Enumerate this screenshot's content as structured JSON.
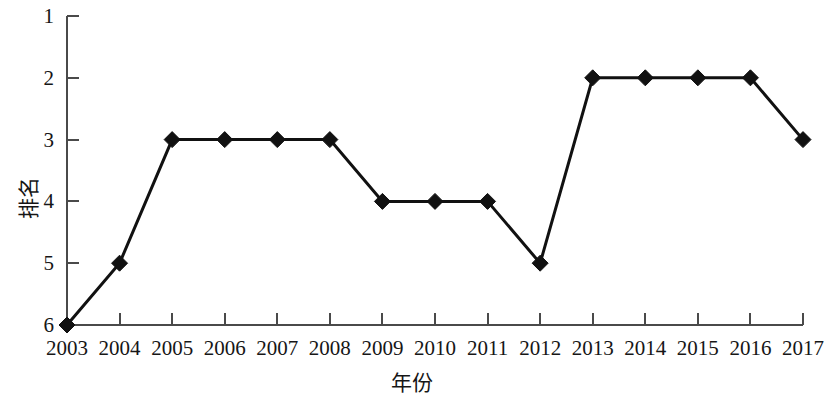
{
  "chart_data": {
    "type": "line",
    "title": "",
    "xlabel": "年份",
    "ylabel": "排名",
    "x": [
      2003,
      2004,
      2005,
      2006,
      2007,
      2008,
      2009,
      2010,
      2011,
      2012,
      2013,
      2014,
      2015,
      2016,
      2017
    ],
    "categories": [
      "2003",
      "2004",
      "2005",
      "2006",
      "2007",
      "2008",
      "2009",
      "2010",
      "2011",
      "2012",
      "2013",
      "2014",
      "2015",
      "2016",
      "2017"
    ],
    "values": [
      6,
      5,
      3,
      3,
      3,
      3,
      4,
      4,
      4,
      5,
      2,
      2,
      2,
      2,
      3
    ],
    "series": [
      {
        "name": "排名",
        "values": [
          6,
          5,
          3,
          3,
          3,
          3,
          4,
          4,
          4,
          5,
          2,
          2,
          2,
          2,
          3
        ]
      }
    ],
    "yticks": [
      "1",
      "2",
      "3",
      "4",
      "5",
      "6"
    ],
    "ytick_values": [
      1,
      2,
      3,
      4,
      5,
      6
    ],
    "ylim": [
      1,
      6
    ],
    "y_axis_inverted": true,
    "xlim": [
      2003,
      2017
    ],
    "grid": false,
    "legend": false,
    "legend_position": "none",
    "marker": "diamond",
    "marker_color": "#111111",
    "line_color": "#111111",
    "line_width": 3,
    "annotations": []
  }
}
